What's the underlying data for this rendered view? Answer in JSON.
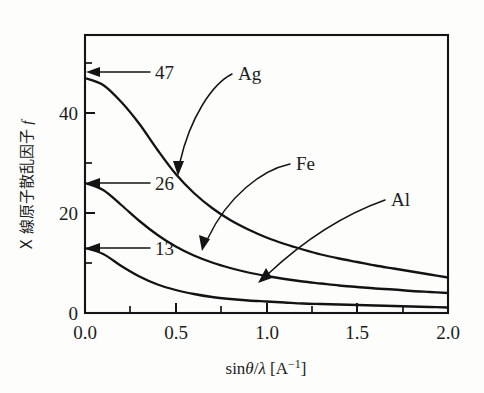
{
  "chart_data": {
    "type": "line",
    "title": "",
    "xlabel": "sinθ/λ [A⁻¹]",
    "ylabel": "X 線原子散乱因子 f",
    "ylabel_parts": {
      "main": "X 線原子散乱因子",
      "symbol": "f"
    },
    "xlabel_parts": {
      "func": "sin",
      "theta": "θ",
      "slash": "/",
      "lambda": "λ",
      "unit_open": "[A",
      "unit_exp": "−1",
      "unit_close": "]"
    },
    "xlim": [
      0.0,
      2.0
    ],
    "ylim": [
      0,
      50
    ],
    "grid": false,
    "legend_position": "inline-labels",
    "x_major_ticks": [
      "0.0",
      "0.5",
      "1.0",
      "1.5",
      "2.0"
    ],
    "x_major_values": [
      0.0,
      0.5,
      1.0,
      1.5,
      2.0
    ],
    "x_minor_values": [
      0.25,
      0.75,
      1.25,
      1.75
    ],
    "y_major_ticks": [
      "0",
      "20",
      "40"
    ],
    "y_major_values": [
      0,
      20,
      40
    ],
    "y_minor_values": [
      10,
      30,
      50
    ],
    "x": [
      0.0,
      0.1,
      0.2,
      0.3,
      0.4,
      0.5,
      0.6,
      0.7,
      0.8,
      0.9,
      1.0,
      1.1,
      1.2,
      1.3,
      1.4,
      1.5,
      1.6,
      1.7,
      1.8,
      1.9,
      2.0
    ],
    "series": [
      {
        "name": "Ag",
        "label": "Ag",
        "start_value": 47,
        "start_annotation": "47",
        "end_value": 7,
        "values": [
          47.0,
          45.6,
          42.2,
          37.8,
          32.6,
          27.8,
          24.0,
          21.0,
          18.6,
          16.7,
          15.1,
          13.8,
          12.7,
          11.7,
          10.9,
          10.2,
          9.5,
          8.9,
          8.3,
          7.7,
          7.1
        ]
      },
      {
        "name": "Fe",
        "label": "Fe",
        "start_value": 26,
        "start_annotation": "26",
        "end_value": 4,
        "values": [
          26.0,
          24.6,
          21.6,
          18.4,
          15.6,
          13.3,
          11.5,
          10.1,
          9.0,
          8.1,
          7.4,
          6.8,
          6.3,
          5.9,
          5.5,
          5.2,
          4.9,
          4.7,
          4.4,
          4.2,
          4.0
        ]
      },
      {
        "name": "Al",
        "label": "Al",
        "start_value": 13,
        "start_annotation": "13",
        "end_value": 1,
        "values": [
          13.0,
          11.8,
          9.4,
          7.3,
          5.7,
          4.6,
          3.8,
          3.2,
          2.8,
          2.5,
          2.3,
          2.1,
          1.9,
          1.8,
          1.7,
          1.6,
          1.5,
          1.4,
          1.3,
          1.2,
          1.1
        ]
      }
    ],
    "annotations": [
      {
        "text": "47",
        "points_to": "Ag curve at x=0"
      },
      {
        "text": "26",
        "points_to": "Fe curve at x=0"
      },
      {
        "text": "13",
        "points_to": "Al curve at x=0"
      },
      {
        "text": "Ag",
        "points_to": "Ag curve near x=0.5"
      },
      {
        "text": "Fe",
        "points_to": "Fe curve near x=0.55"
      },
      {
        "text": "Al",
        "points_to": "Al curve near x=0.95"
      }
    ],
    "colors": {
      "curve": "#131313",
      "axis": "#141414",
      "text": "#1c1c1c",
      "background": "#fdfdfb"
    }
  }
}
